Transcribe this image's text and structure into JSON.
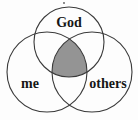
{
  "diagram": {
    "type": "venn-3-circle",
    "background_color": "#fdfdfd",
    "stroke_color": "#3a3a3a",
    "text_color": "#161616",
    "intersection_fill": "#949494",
    "circles": [
      {
        "id": "god",
        "label": "God",
        "cx": 69,
        "cy": 42,
        "r": 35,
        "label_x": 69,
        "label_y": 24,
        "font_size": 14
      },
      {
        "id": "me",
        "label": "me",
        "cx": 47,
        "cy": 72,
        "r": 40,
        "label_x": 30,
        "label_y": 85,
        "font_size": 14
      },
      {
        "id": "others",
        "label": "others",
        "cx": 92,
        "cy": 72,
        "r": 40,
        "label_x": 108,
        "label_y": 85,
        "font_size": 14
      }
    ],
    "shaded_region": {
      "name": "all-three-intersection",
      "fill": "#949494",
      "stroke": "#3a3a3a"
    },
    "speck": {
      "cx": 64,
      "cy": 3,
      "r": 0.9
    }
  }
}
